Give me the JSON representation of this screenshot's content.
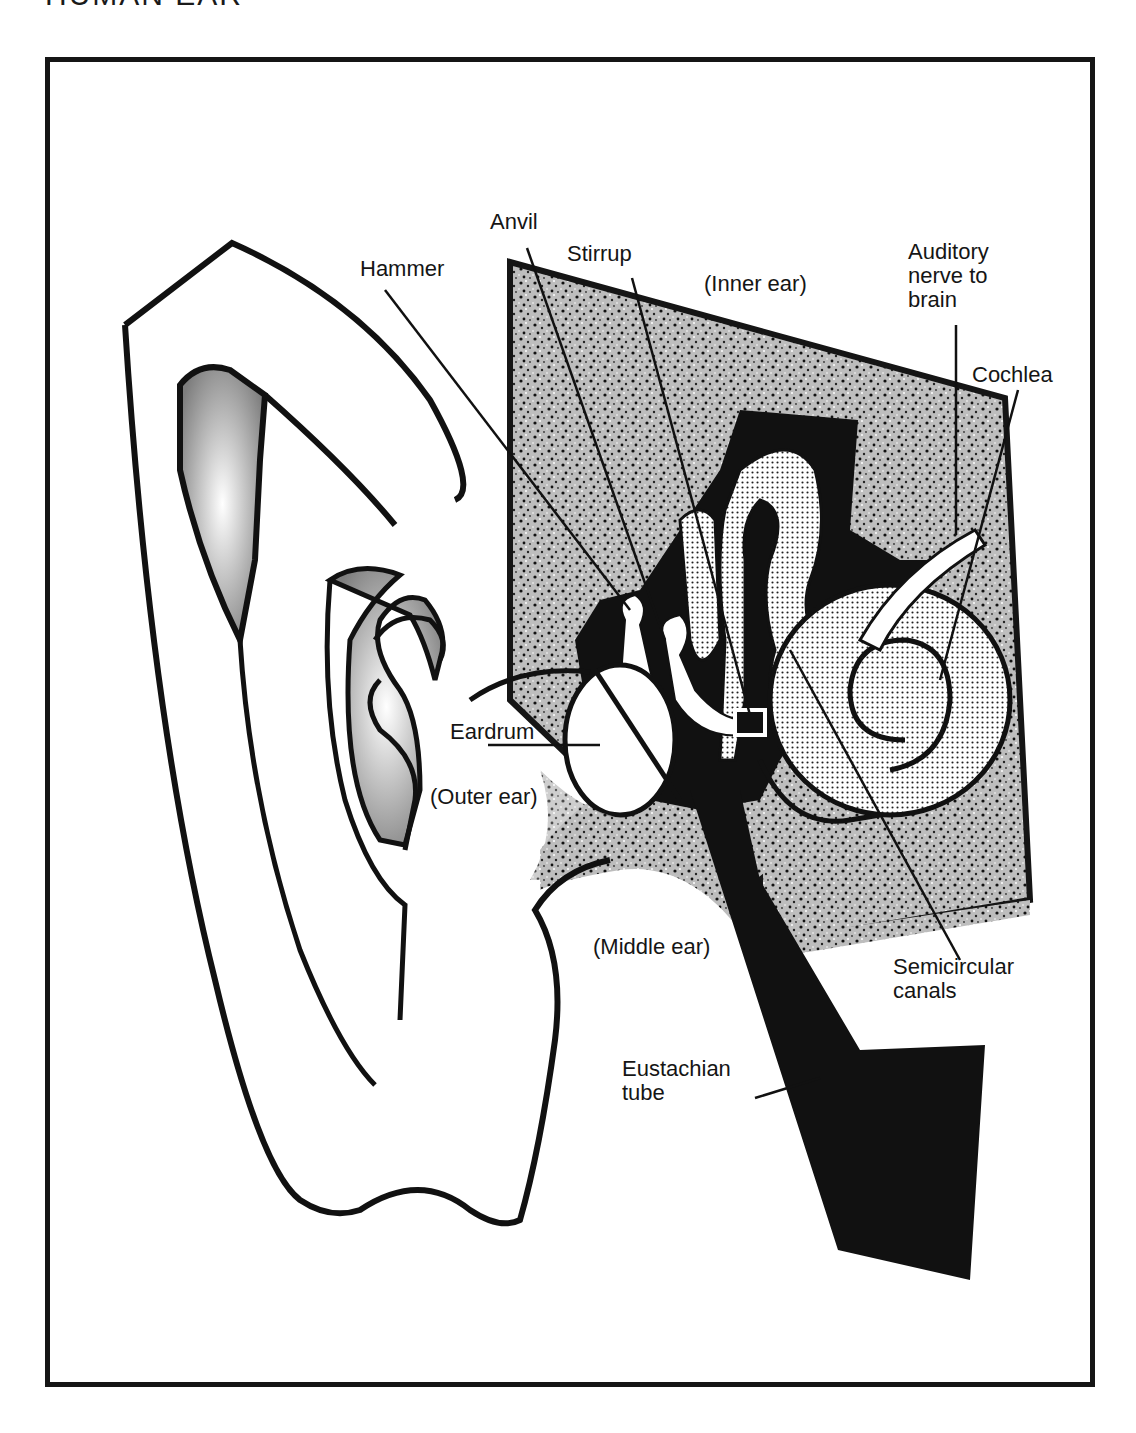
{
  "title": "HUMAN EAR",
  "colors": {
    "ink": "#151515",
    "paper": "#ffffff",
    "stipple_light": "#d9d9d9",
    "stipple_dark": "#8a8a8a"
  },
  "labels": {
    "anvil": "Anvil",
    "stirrup": "Stirrup",
    "hammer": "Hammer",
    "inner_ear": "(Inner ear)",
    "auditory_nerve": "Auditory\nnerve to\nbrain",
    "cochlea": "Cochlea",
    "eardrum": "Eardrum",
    "outer_ear": "(Outer ear)",
    "middle_ear": "(Middle ear)",
    "semicircular_canals": "Semicircular\ncanals",
    "eustachian_tube": "Eustachian\ntube"
  }
}
